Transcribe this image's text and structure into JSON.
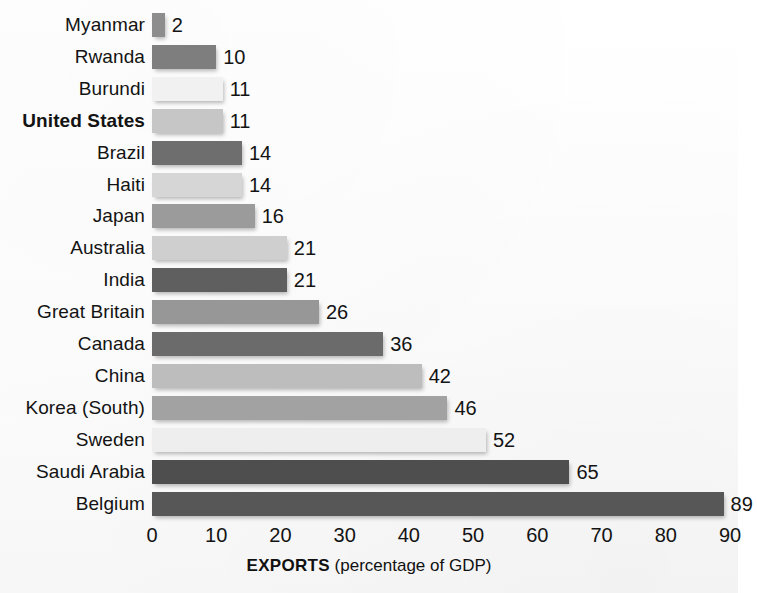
{
  "chart_data": {
    "type": "bar",
    "orientation": "horizontal",
    "title": "",
    "xlabel_strong": "EXPORTS",
    "xlabel_rest": " (percentage of GDP)",
    "ylabel": "",
    "xlim": [
      0,
      90
    ],
    "xticks": [
      0,
      10,
      20,
      30,
      40,
      50,
      60,
      70,
      80,
      90
    ],
    "xtick_labels": [
      "0",
      "10",
      "20",
      "30",
      "40",
      "50",
      "60",
      "70",
      "80",
      "90"
    ],
    "grid": false,
    "legend": "none",
    "value_unit": "percent of GDP",
    "categories": [
      "Myanmar",
      "Rwanda",
      "Burundi",
      "United States",
      "Brazil",
      "Haiti",
      "Japan",
      "Australia",
      "India",
      "Great Britain",
      "Canada",
      "China",
      "Korea (South)",
      "Sweden",
      "Saudi Arabia",
      "Belgium"
    ],
    "values": [
      2,
      10,
      11,
      11,
      14,
      14,
      16,
      21,
      21,
      26,
      36,
      42,
      46,
      52,
      65,
      89
    ],
    "value_labels": [
      "2",
      "10",
      "11",
      "11",
      "14",
      "14",
      "16",
      "21",
      "21",
      "26",
      "36",
      "42",
      "46",
      "52",
      "65",
      "89"
    ],
    "bar_colors": [
      "#8d8d8d",
      "#7e7e7e",
      "#f1f1f1",
      "#c6c6c6",
      "#6e6e6e",
      "#d6d6d6",
      "#9b9b9b",
      "#cfcfcf",
      "#5f5f5f",
      "#979797",
      "#6b6b6b",
      "#bdbdbd",
      "#a2a2a2",
      "#eeeeee",
      "#4e4e4e",
      "#575757"
    ],
    "highlighted_category": "United States"
  }
}
